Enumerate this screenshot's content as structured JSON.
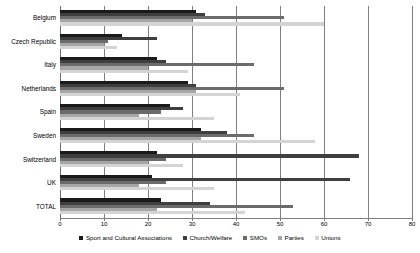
{
  "chart_data": {
    "type": "bar",
    "orientation": "horizontal",
    "title": "",
    "subtitle": "",
    "xlabel": "",
    "ylabel": "",
    "xlim": [
      0,
      80
    ],
    "xticks": [
      0,
      10,
      20,
      30,
      40,
      50,
      60,
      70,
      80
    ],
    "xtick_labels": [
      "0",
      "10",
      "20",
      "30",
      "40",
      "50",
      "60",
      "70",
      "80"
    ],
    "grid": true,
    "grid_axis": "x",
    "legend_position": "bottom",
    "categories": [
      "Belgium",
      "Czech Republic",
      "Italy",
      "Netherlands",
      "Spain",
      "Sweden",
      "Switzerland",
      "UK",
      "TOTAL"
    ],
    "series": [
      {
        "name": "Sport and Cultural Associations",
        "color": "#1a1a1a",
        "values": [
          31,
          14,
          22,
          29,
          25,
          32,
          22,
          21,
          23
        ]
      },
      {
        "name": "Church/Welfare",
        "color": "#3f3f3f",
        "values": [
          33,
          22,
          24,
          31,
          28,
          38,
          68,
          66,
          34
        ]
      },
      {
        "name": "SMOs",
        "color": "#6b6b6b",
        "values": [
          51,
          11,
          44,
          51,
          23,
          44,
          24,
          24,
          53
        ]
      },
      {
        "name": "Parties",
        "color": "#a6a6a6",
        "values": [
          30,
          10,
          20,
          31,
          18,
          32,
          20,
          18,
          22
        ]
      },
      {
        "name": "Unions",
        "color": "#d4d4d4",
        "values": [
          60,
          13,
          29,
          41,
          35,
          58,
          28,
          35,
          42
        ]
      }
    ]
  }
}
